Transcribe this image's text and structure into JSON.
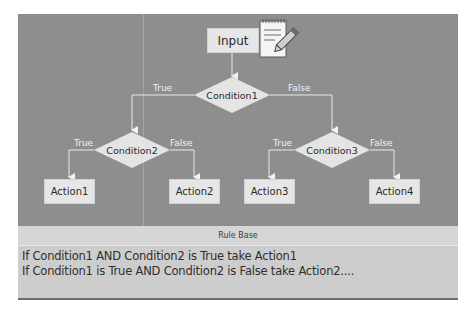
{
  "diagram": {
    "input": {
      "label": "Input",
      "icon": "notepad-pencil-icon"
    },
    "conditions": [
      {
        "id": "c1",
        "label": "Condition1",
        "true_label": "True",
        "false_label": "False"
      },
      {
        "id": "c2",
        "label": "Condition2",
        "true_label": "True",
        "false_label": "False"
      },
      {
        "id": "c3",
        "label": "Condition3",
        "true_label": "True",
        "false_label": "False"
      }
    ],
    "actions": [
      {
        "label": "Action1"
      },
      {
        "label": "Action2"
      },
      {
        "label": "Action3"
      },
      {
        "label": "Action4"
      }
    ],
    "colors": {
      "background": "#8e8e8e",
      "node_fill": "#e6e6e6",
      "connector": "#e8e8e8",
      "branch_text": "#f0f0f0"
    }
  },
  "rule_base": {
    "title": "Rule Base",
    "rules": [
      "If Condition1 AND Condition2 is True take Action1",
      "If Condition1 is True AND Condition2 is False take Action2...."
    ]
  }
}
